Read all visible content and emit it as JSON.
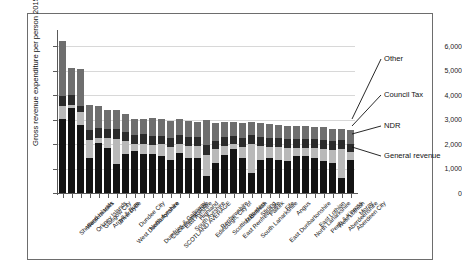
{
  "chart_data": {
    "type": "bar",
    "subtype": "stacked-bar",
    "title": "",
    "xlabel": "",
    "ylabel": "Gross revenue expenditure per person 2015-16 / £",
    "ylim": [
      0,
      6500
    ],
    "yticks": [
      0,
      1000,
      2000,
      3000,
      4000,
      5000,
      6000
    ],
    "ytick_labels": [
      "0",
      "1,000",
      "2,000",
      "3,000",
      "4,000",
      "5,000",
      "6,000"
    ],
    "grid": "horizontal",
    "legend_position": "annotations-right",
    "series_order_bottom_to_top": [
      "General revenue",
      "NDR",
      "Council Tax",
      "Other"
    ],
    "series_colors": {
      "General revenue": "#141414",
      "NDR": "#b9b9b9",
      "Council Tax": "#2b2b2b",
      "Other": "#6e6e6e"
    },
    "categories": [
      "Shetland Islands",
      "Western Isles",
      "Orkney Islands",
      "Glasgow City",
      "Argyll & Bute",
      "Inverclyde",
      "West Dunbartonshire",
      "Dundee City",
      "North Ayrshire",
      "Dumfries & Galloway",
      "Clackmannanshire",
      "SCOTLAND AVERAGE",
      "East Ayrshire",
      "South Ayrshire",
      "Highland",
      "Edinburgh, City of",
      "Renfrewshire",
      "Scottish Borders",
      "East Renfrewshire",
      "Midlothian",
      "South Lanarkshire",
      "Stirling",
      "Falkirk",
      "East Dunbartonshire",
      "Fife",
      "Angus",
      "North Lanarkshire",
      "East Lothian",
      "Perth & Kinross",
      "West Lothian",
      "Aberdeenshire",
      "Aberdeen City",
      "Moray"
    ],
    "series": [
      {
        "name": "General revenue",
        "values": [
          3020,
          3460,
          2800,
          1430,
          2030,
          1850,
          1200,
          1600,
          1720,
          1600,
          1580,
          1500,
          1340,
          1640,
          1440,
          1430,
          700,
          1230,
          1560,
          1780,
          1420,
          830,
          1340,
          1420,
          1330,
          1300,
          1530,
          1520,
          1420,
          1320,
          1230,
          620,
          1370
        ]
      },
      {
        "name": "NDR",
        "values": [
          530,
          130,
          500,
          740,
          230,
          380,
          1010,
          530,
          280,
          420,
          400,
          490,
          550,
          380,
          500,
          490,
          870,
          550,
          370,
          210,
          480,
          1170,
          580,
          480,
          560,
          540,
          330,
          330,
          430,
          490,
          530,
          1170,
          300
        ]
      },
      {
        "name": "Council Tax",
        "values": [
          430,
          420,
          250,
          420,
          400,
          400,
          390,
          370,
          380,
          380,
          370,
          360,
          360,
          360,
          370,
          360,
          400,
          360,
          370,
          360,
          360,
          360,
          360,
          360,
          360,
          370,
          350,
          350,
          360,
          360,
          350,
          360,
          350
        ]
      },
      {
        "name": "Other",
        "values": [
          2220,
          1090,
          1500,
          1020,
          900,
          770,
          800,
          740,
          660,
          640,
          700,
          680,
          690,
          630,
          640,
          640,
          1030,
          720,
          590,
          550,
          590,
          560,
          590,
          560,
          540,
          530,
          540,
          530,
          500,
          530,
          520,
          450,
          560
        ]
      }
    ],
    "totals": [
      6200,
      5100,
      5050,
      3610,
      3560,
      3400,
      3400,
      3240,
      3040,
      3040,
      3050,
      3030,
      2940,
      3010,
      2950,
      2920,
      3000,
      2860,
      2890,
      2900,
      2850,
      2920,
      2870,
      2820,
      2790,
      2740,
      2750,
      2730,
      2710,
      2700,
      2630,
      2600,
      2580
    ],
    "annotations": [
      {
        "label": "Other",
        "points_to": "top segment of last bar"
      },
      {
        "label": "Council Tax",
        "points_to": "third segment of last bar"
      },
      {
        "label": "NDR",
        "points_to": "second segment of last bar"
      },
      {
        "label": "General revenue",
        "points_to": "bottom segment of last bar"
      }
    ]
  }
}
